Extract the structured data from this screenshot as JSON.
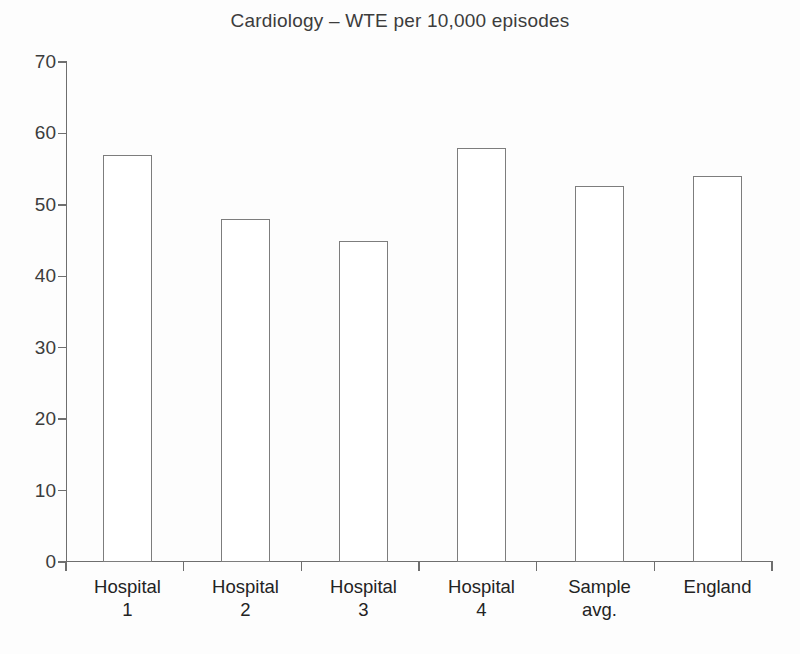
{
  "chart_data": {
    "type": "bar",
    "title": "Cardiology – WTE per 10,000 episodes",
    "xlabel": "",
    "ylabel": "",
    "ylim": [
      0,
      70
    ],
    "yticks": [
      0,
      10,
      20,
      30,
      40,
      50,
      60,
      70
    ],
    "ytick_labels": [
      "0",
      "10",
      "20",
      "30",
      "40",
      "50",
      "60",
      "70"
    ],
    "grid": false,
    "legend": null,
    "categories": [
      "Hospital\n1",
      "Hospital\n2",
      "Hospital\n3",
      "Hospital\n4",
      "Sample\navg.",
      "England"
    ],
    "values": [
      57,
      48,
      45,
      58,
      52.7,
      54
    ],
    "bar_style": {
      "fill": "#ffffff",
      "edge": "#7d7d7d"
    }
  },
  "figure": {
    "background": "#fdfdfd",
    "text_color": "#3c3c3c",
    "axis_color": "#6e6e6e"
  }
}
